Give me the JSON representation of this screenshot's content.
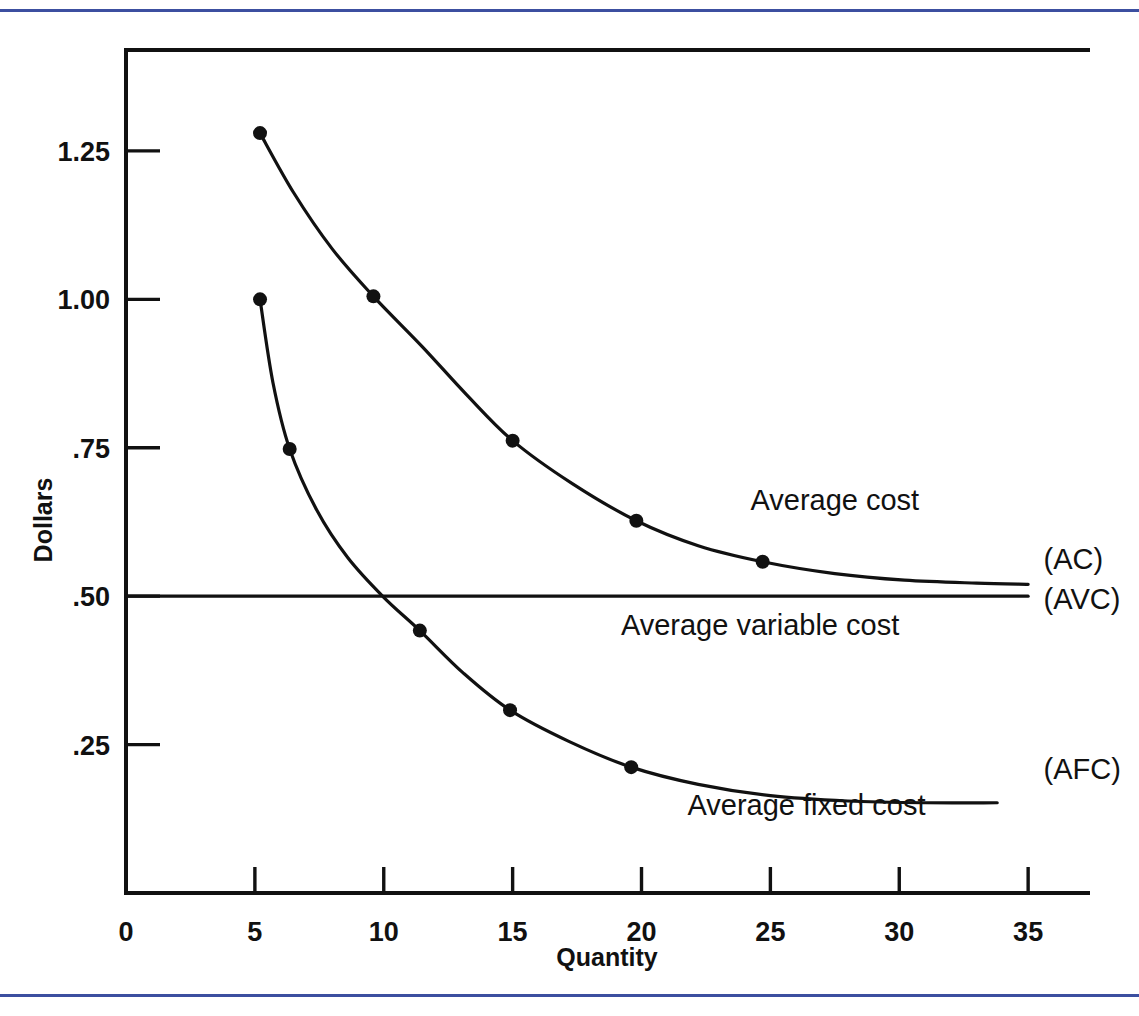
{
  "figure": {
    "frame_color": "#111111",
    "accent_rule_color": "#3c4fa0",
    "background": "#ffffff"
  },
  "chart_data": {
    "type": "line",
    "title": "",
    "xlabel": "Quantity",
    "ylabel": "Dollars",
    "xlim": [
      0,
      37.4
    ],
    "ylim": [
      0,
      1.42
    ],
    "xticks": [
      0,
      5,
      10,
      15,
      20,
      25,
      30,
      35
    ],
    "xticklabels": [
      "0",
      "5",
      "10",
      "15",
      "20",
      "25",
      "30",
      "35"
    ],
    "yticks": [
      0.25,
      0.5,
      0.75,
      1.0,
      1.25
    ],
    "yticklabels": [
      ".25",
      ".50",
      ".75",
      "1.00",
      "1.25"
    ],
    "grid": false,
    "legend_position": "inline-right",
    "series": [
      {
        "name": "Average cost",
        "abbr": "(AC)",
        "label": "Average cost",
        "label_anchor_x": 27.5,
        "label_anchor_y": 0.645,
        "abbr_x": 35.6,
        "abbr_y": 0.545,
        "markers_x": [
          5.2,
          9.6,
          15.0,
          19.8,
          24.7
        ],
        "markers_y": [
          1.28,
          1.005,
          0.762,
          0.627,
          0.558
        ],
        "path_x": [
          5.2,
          6.5,
          8.0,
          9.6,
          11.5,
          13.2,
          15.0,
          17.3,
          19.8,
          22.2,
          24.7,
          27.5,
          30.2,
          33.0,
          35.0
        ],
        "path_y": [
          1.28,
          1.18,
          1.085,
          1.005,
          0.92,
          0.84,
          0.762,
          0.69,
          0.627,
          0.585,
          0.558,
          0.538,
          0.527,
          0.522,
          0.52
        ]
      },
      {
        "name": "Average variable cost",
        "abbr": "(AVC)",
        "label": "Average variable cost",
        "label_anchor_x": 24.6,
        "label_anchor_y": 0.435,
        "abbr_x": 35.6,
        "abbr_y": 0.478,
        "constant_value": 0.5,
        "x_start": 0.0,
        "x_end": 35.0,
        "markers_x": [],
        "markers_y": []
      },
      {
        "name": "Average fixed cost",
        "abbr": "(AFC)",
        "label": "Average fixed cost",
        "label_anchor_x": 26.4,
        "label_anchor_y": 0.132,
        "abbr_x": 35.6,
        "abbr_y": 0.192,
        "markers_x": [
          5.2,
          6.35,
          11.4,
          14.9,
          19.6
        ],
        "markers_y": [
          1.0,
          0.748,
          0.442,
          0.308,
          0.212
        ],
        "path_x": [
          5.2,
          5.7,
          6.35,
          7.4,
          8.6,
          10.0,
          11.4,
          13.1,
          14.9,
          17.2,
          19.6,
          22.2,
          25.0,
          28.0,
          31.0,
          33.8
        ],
        "path_y": [
          1.0,
          0.86,
          0.748,
          0.645,
          0.565,
          0.498,
          0.442,
          0.37,
          0.308,
          0.255,
          0.212,
          0.183,
          0.164,
          0.155,
          0.152,
          0.152
        ]
      }
    ]
  }
}
